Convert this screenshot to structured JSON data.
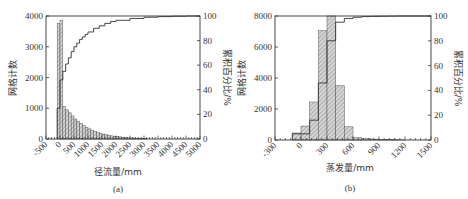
{
  "chart_data": [
    {
      "type": "bar",
      "panel_label": "(a)",
      "title": "",
      "xlabel": "径流量/mm",
      "ylabel": "网格计数",
      "y2label": "累积百分比/%",
      "xlim": [
        -500,
        5000
      ],
      "ylim": [
        0,
        4000
      ],
      "y2lim": [
        0,
        100
      ],
      "xticks": [
        "-500",
        "0",
        "500",
        "1000",
        "1500",
        "2000",
        "2500",
        "3000",
        "3500",
        "4000",
        "4500",
        "5000"
      ],
      "yticks": [
        "0",
        "1000",
        "2000",
        "3000",
        "4000"
      ],
      "y2ticks": [
        "0",
        "20",
        "40",
        "60",
        "80",
        "100"
      ],
      "bin_width": 100,
      "bins_start": [
        -100,
        0,
        100,
        200,
        300,
        400,
        500,
        600,
        700,
        800,
        900,
        1000,
        1100,
        1200,
        1300,
        1400,
        1500,
        1600,
        1700,
        1800,
        1900,
        2000,
        2100,
        2200,
        2300,
        2400,
        2500,
        2600,
        2700,
        2800,
        2900,
        3000
      ],
      "series": [
        {
          "name": "网格计数",
          "kind": "histogram",
          "values": [
            3750,
            3850,
            1050,
            950,
            850,
            750,
            650,
            580,
            500,
            440,
            380,
            330,
            290,
            250,
            210,
            180,
            160,
            140,
            120,
            100,
            90,
            80,
            70,
            60,
            50,
            40,
            35,
            30,
            25,
            20,
            15,
            10
          ]
        },
        {
          "name": "累积百分比",
          "kind": "step-line",
          "axis": "y2",
          "x": [
            -100,
            0,
            100,
            200,
            300,
            400,
            500,
            600,
            700,
            800,
            900,
            1000,
            1200,
            1400,
            1600,
            1800,
            2000,
            2500,
            3000,
            3500,
            4000,
            4500,
            5000
          ],
          "values": [
            25,
            48,
            55,
            61,
            66,
            71,
            75,
            78,
            81,
            83,
            85,
            87,
            90,
            92,
            94,
            95.5,
            96.5,
            98,
            99,
            99.5,
            99.8,
            100,
            100
          ]
        }
      ],
      "grid": false,
      "legend": "none"
    },
    {
      "type": "bar",
      "panel_label": "(b)",
      "title": "",
      "xlabel": "蒸发量/mm",
      "ylabel": "网格计数",
      "y2label": "累积百分比/%",
      "xlim": [
        -300,
        1500
      ],
      "ylim": [
        0,
        8000
      ],
      "y2lim": [
        0,
        100
      ],
      "xticks": [
        "-300",
        "0",
        "300",
        "600",
        "900",
        "1200",
        "1500"
      ],
      "yticks": [
        "0",
        "2000",
        "4000",
        "6000",
        "8000"
      ],
      "y2ticks": [
        "0",
        "20",
        "40",
        "60",
        "80",
        "100"
      ],
      "bin_width": 100,
      "bins_start": [
        -100,
        0,
        100,
        200,
        300,
        400,
        500,
        600,
        700,
        800,
        900,
        1000,
        1100
      ],
      "series": [
        {
          "name": "网格计数",
          "kind": "histogram",
          "values": [
            450,
            900,
            2450,
            7050,
            8000,
            3500,
            850,
            150,
            100,
            60,
            30,
            20,
            10
          ]
        },
        {
          "name": "累积百分比",
          "kind": "step-line",
          "axis": "y2",
          "x": [
            -100,
            0,
            100,
            200,
            300,
            400,
            500,
            600,
            700,
            800,
            900,
            1000,
            1100,
            1200,
            1500
          ],
          "values": [
            5,
            5,
            16,
            46,
            80,
            95,
            98,
            99,
            99.5,
            99.7,
            99.8,
            99.9,
            100,
            100,
            100
          ]
        }
      ],
      "grid": false,
      "legend": "none"
    }
  ]
}
